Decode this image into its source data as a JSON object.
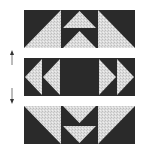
{
  "diagram": {
    "type": "quilt-block-rows",
    "colors": {
      "dark": "#2a2a2a",
      "light": "#d8d8d8",
      "arrow": "#333333",
      "background": "#ffffff"
    },
    "rows": [
      {
        "name": "top-row",
        "pattern": "flying-geese-up",
        "units": [
          "half-square-triangle-left",
          "two-geese-up",
          "half-square-triangle-right"
        ]
      },
      {
        "name": "middle-row",
        "pattern": "geese-pointing-outward",
        "units": [
          "two-geese-left",
          "dark-square",
          "two-geese-right"
        ]
      },
      {
        "name": "bottom-row",
        "pattern": "flying-geese-down",
        "units": [
          "half-square-triangle-left",
          "two-geese-down",
          "half-square-triangle-right"
        ]
      }
    ],
    "arrows": [
      {
        "name": "up-arrow",
        "direction": "up"
      },
      {
        "name": "down-arrow",
        "direction": "down"
      }
    ]
  }
}
